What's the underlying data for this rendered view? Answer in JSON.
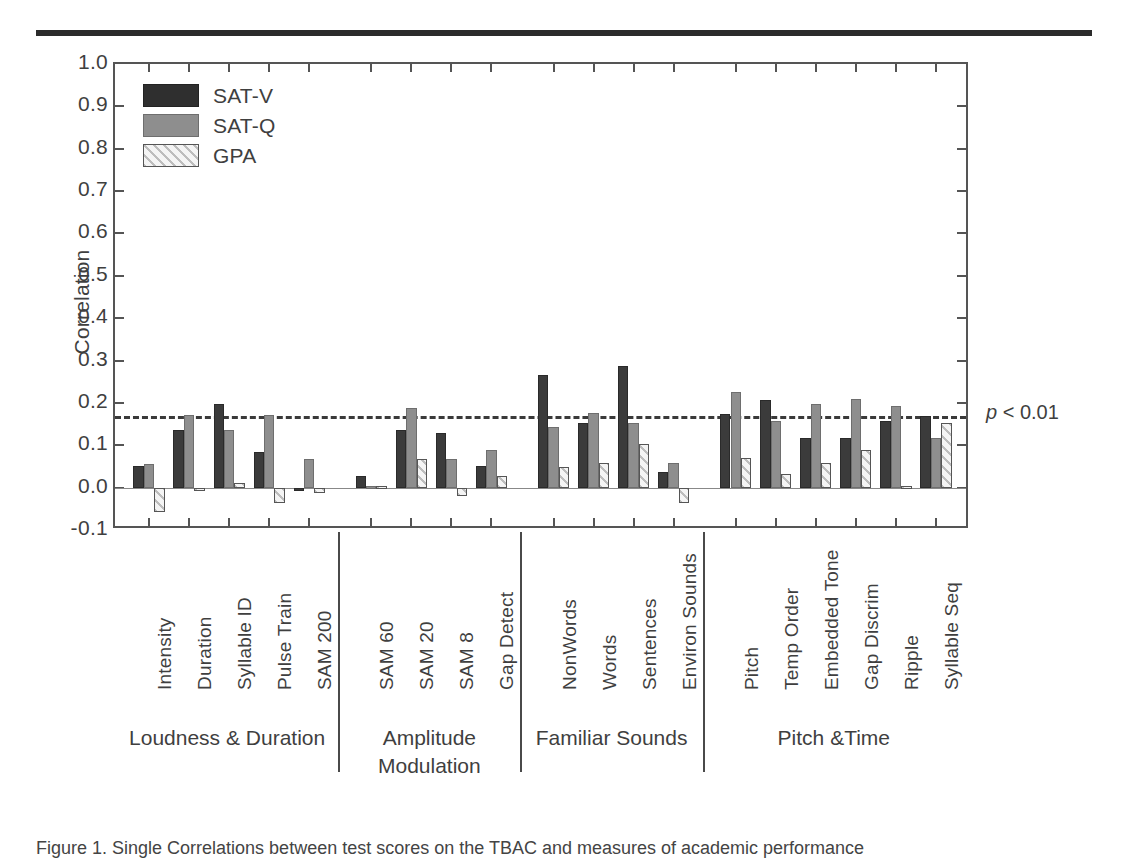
{
  "figure": {
    "top_rule": true,
    "caption": "Figure 1. Single Correlations between test scores on the TBAC and measures of academic performance"
  },
  "legend": {
    "position": "top-left-inside",
    "items": [
      {
        "label": "SAT-V",
        "key": "satv",
        "color": "#2f2f2f"
      },
      {
        "label": "SAT-Q",
        "key": "satq",
        "color": "#8e8e8e"
      },
      {
        "label": "GPA",
        "key": "gpa",
        "color": "#f2f2f2"
      }
    ]
  },
  "axes": {
    "ylabel": "Correlation",
    "ytick_labels": [
      "1.0",
      "0.9",
      "0.8",
      "0.7",
      "0.6",
      "0.5",
      "0.4",
      "0.3",
      "0.2",
      "0.1",
      "0.0",
      "-0.1"
    ],
    "ytick_values": [
      1.0,
      0.9,
      0.8,
      0.7,
      0.6,
      0.5,
      0.4,
      0.3,
      0.2,
      0.1,
      0.0,
      -0.1
    ],
    "ylim": [
      -0.1,
      1.0
    ],
    "grid": false
  },
  "annotations": [
    {
      "name": "significance-line",
      "value": 0.17,
      "label": "p < 0.01",
      "style": "dashed"
    }
  ],
  "groups": [
    {
      "label": "Loudness & Duration",
      "lines": [
        "Loudness & Duration"
      ],
      "count": 5
    },
    {
      "label": "Amplitude Modulation",
      "lines": [
        "Amplitude",
        "Modulation"
      ],
      "count": 4
    },
    {
      "label": "Familiar Sounds",
      "lines": [
        "Familiar Sounds"
      ],
      "count": 4
    },
    {
      "label": "Pitch &Time",
      "lines": [
        "Pitch &Time"
      ],
      "count": 6
    }
  ],
  "chart_data": {
    "type": "bar",
    "title": "",
    "xlabel": "",
    "ylabel": "Correlation",
    "ylim": [
      -0.1,
      1.0
    ],
    "grid": false,
    "legend_position": "inside top-left",
    "categories": [
      "Intensity",
      "Duration",
      "Syllable ID",
      "Pulse Train",
      "SAM 200",
      "SAM 60",
      "SAM 20",
      "SAM 8",
      "Gap Detect",
      "NonWords",
      "Words",
      "Sentences",
      "Environ Sounds",
      "Pitch",
      "Temp Order",
      "Embedded Tone",
      "Gap Discrim",
      "Ripple",
      "Syllable Seq"
    ],
    "series": [
      {
        "name": "SAT-V",
        "color": "#2f2f2f",
        "values": [
          0.05,
          0.135,
          0.197,
          0.085,
          0.0,
          0.028,
          0.135,
          0.13,
          0.052,
          0.265,
          0.152,
          0.288,
          0.036,
          0.175,
          0.208,
          0.117,
          0.117,
          0.158,
          0.168
        ]
      },
      {
        "name": "SAT-Q",
        "color": "#8e8e8e",
        "values": [
          0.055,
          0.172,
          0.135,
          0.172,
          0.068,
          0.005,
          0.188,
          0.068,
          0.09,
          0.142,
          0.176,
          0.152,
          0.058,
          0.225,
          0.158,
          0.197,
          0.21,
          0.193,
          0.117
        ]
      },
      {
        "name": "GPA",
        "color": "#f2f2f2",
        "hatch": "diagonal",
        "values": [
          -0.058,
          0.0,
          0.012,
          -0.036,
          -0.013,
          0.005,
          0.068,
          -0.02,
          0.028,
          0.048,
          0.057,
          0.103,
          -0.036,
          0.07,
          0.032,
          0.057,
          0.088,
          0.003,
          0.152
        ]
      }
    ],
    "annotations": [
      {
        "type": "hline",
        "value": 0.17,
        "label": "p < 0.01",
        "style": "dashed"
      }
    ]
  }
}
